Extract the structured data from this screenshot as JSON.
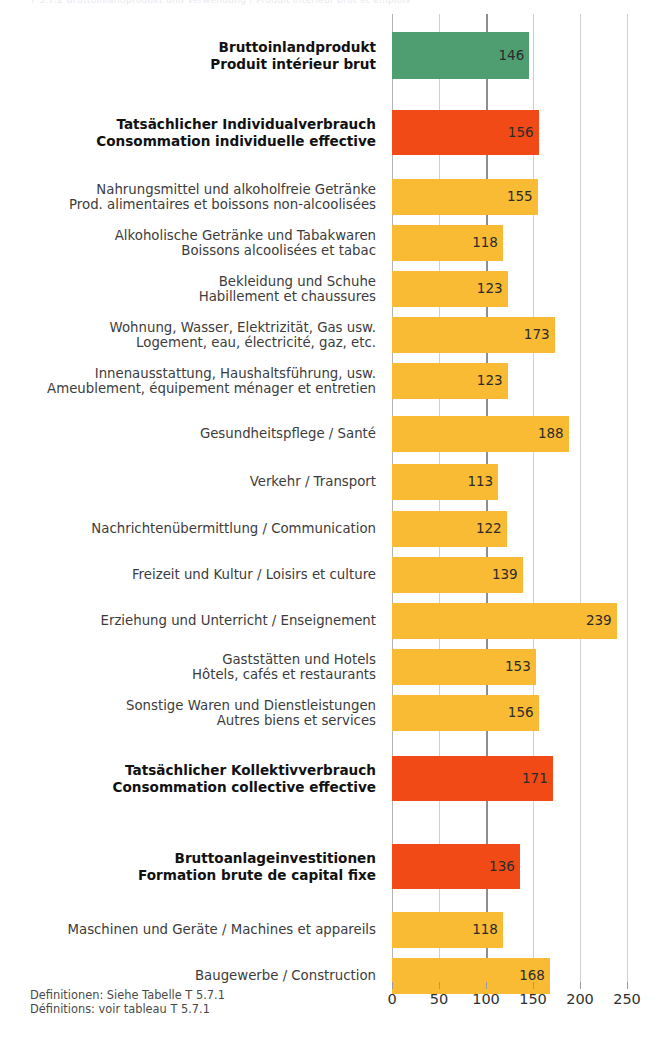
{
  "top_strip": {
    "text": "T 5.7.2  Bruttoinlandprodukt und Verwendung / Produit intérieur brut et emplois"
  },
  "footnote": {
    "line_de": "Definitionen: Siehe Tabelle T 5.7.1",
    "line_fr": "Définitions: voir tableau T 5.7.1"
  },
  "colors": {
    "green": "#4f9e72",
    "red": "#f24a16",
    "yellow": "#f9bb33",
    "gridline": "#cfcfcf",
    "gridline_major": "#8e8e8e",
    "value_text": "#2b2b2b"
  },
  "chart_data": {
    "type": "bar",
    "orientation": "horizontal",
    "title": "",
    "subtitle": "",
    "xlabel": "",
    "ylabel": "",
    "xlim": [
      0,
      250
    ],
    "ticks": [
      0,
      50,
      100,
      150,
      200,
      250
    ],
    "tick_labels": [
      "0",
      "50",
      "100",
      "150",
      "200",
      "250"
    ],
    "grid": true,
    "reference_line": 100,
    "legend": [],
    "categories": [
      "Bruttoinlandprodukt / Produit intérieur brut",
      "Tatsächlicher Individualverbrauch / Consommation individuelle effective",
      "Nahrungsmittel und alkoholfreie Getränke / Prod. alimentaires et boissons non-alcoolisées",
      "Alkoholische Getränke und Tabakwaren / Boissons alcoolisées et tabac",
      "Bekleidung und Schuhe / Habillement et chaussures",
      "Wohnung, Wasser, Elektrizität, Gas usw. / Logement, eau, électricité, gaz, etc.",
      "Innenausstattung, Haushaltsführung, usw. / Ameublement, équipement ménager et entretien",
      "Gesundheitspflege / Santé",
      "Verkehr / Transport",
      "Nachrichtenübermittlung / Communication",
      "Freizeit und Kultur / Loisirs et culture",
      "Erziehung und Unterricht / Enseignement",
      "Gaststätten und Hotels / Hôtels, cafés et restaurants",
      "Sonstige Waren und Dienstleistungen / Autres biens et services",
      "Tatsächlicher Kollektivverbrauch / Consommation collective effective",
      "Bruttoanlageinvestitionen / Formation brute de capital fixe",
      "Maschinen und Geräte / Machines et appareils",
      "Baugewerbe / Construction"
    ],
    "values": [
      146,
      156,
      155,
      118,
      123,
      173,
      123,
      188,
      113,
      122,
      139,
      239,
      153,
      156,
      171,
      136,
      118,
      168
    ]
  },
  "rows": [
    {
      "de": "Bruttoinlandprodukt",
      "fr": "Produit intérieur brut",
      "value": 146,
      "value_text": "146",
      "color_key": "green",
      "bold": true,
      "top": 18,
      "height": 47
    },
    {
      "de": "Tatsächlicher Individualverbrauch",
      "fr": "Consommation individuelle effective",
      "value": 156,
      "value_text": "156",
      "color_key": "red",
      "bold": true,
      "top": 96,
      "height": 45
    },
    {
      "de": "Nahrungsmittel und alkoholfreie Getränke",
      "fr": "Prod. alimentaires et boissons non-alcoolisées",
      "value": 155,
      "value_text": "155",
      "color_key": "yellow",
      "bold": false,
      "top": 165,
      "height": 36
    },
    {
      "de": "Alkoholische Getränke und Tabakwaren",
      "fr": "Boissons alcoolisées et tabac",
      "value": 118,
      "value_text": "118",
      "color_key": "yellow",
      "bold": false,
      "top": 211,
      "height": 36
    },
    {
      "de": "Bekleidung und Schuhe",
      "fr": "Habillement et chaussures",
      "value": 123,
      "value_text": "123",
      "color_key": "yellow",
      "bold": false,
      "top": 257,
      "height": 36
    },
    {
      "de": "Wohnung, Wasser, Elektrizität, Gas usw.",
      "fr": "Logement, eau, électricité, gaz, etc.",
      "value": 173,
      "value_text": "173",
      "color_key": "yellow",
      "bold": false,
      "top": 303,
      "height": 36
    },
    {
      "de": "Innenausstattung, Haushaltsführung, usw.",
      "fr": "Ameublement, équipement ménager et entretien",
      "value": 123,
      "value_text": "123",
      "color_key": "yellow",
      "bold": false,
      "top": 349,
      "height": 36
    },
    {
      "de": "Gesundheitspflege / Santé",
      "fr": "",
      "value": 188,
      "value_text": "188",
      "color_key": "yellow",
      "bold": false,
      "top": 402,
      "height": 36
    },
    {
      "de": "Verkehr / Transport",
      "fr": "",
      "value": 113,
      "value_text": "113",
      "color_key": "yellow",
      "bold": false,
      "top": 450,
      "height": 36
    },
    {
      "de": "Nachrichtenübermittlung / Communication",
      "fr": "",
      "value": 122,
      "value_text": "122",
      "color_key": "yellow",
      "bold": false,
      "top": 497,
      "height": 36
    },
    {
      "de": "Freizeit und Kultur / Loisirs et culture",
      "fr": "",
      "value": 139,
      "value_text": "139",
      "color_key": "yellow",
      "bold": false,
      "top": 543,
      "height": 36
    },
    {
      "de": "Erziehung und Unterricht / Enseignement",
      "fr": "",
      "value": 239,
      "value_text": "239",
      "color_key": "yellow",
      "bold": false,
      "top": 589,
      "height": 36
    },
    {
      "de": "Gaststätten und Hotels",
      "fr": "Hôtels, cafés et restaurants",
      "value": 153,
      "value_text": "153",
      "color_key": "yellow",
      "bold": false,
      "top": 635,
      "height": 36
    },
    {
      "de": "Sonstige Waren und Dienstleistungen",
      "fr": "Autres biens et services",
      "value": 156,
      "value_text": "156",
      "color_key": "yellow",
      "bold": false,
      "top": 681,
      "height": 36
    },
    {
      "de": "Tatsächlicher Kollektivverbrauch",
      "fr": "Consommation collective effective",
      "value": 171,
      "value_text": "171",
      "color_key": "red",
      "bold": true,
      "top": 742,
      "height": 45
    },
    {
      "de": "Bruttoanlageinvestitionen",
      "fr": "Formation brute de capital fixe",
      "value": 136,
      "value_text": "136",
      "color_key": "red",
      "bold": true,
      "top": 830,
      "height": 45
    },
    {
      "de": "Maschinen und Geräte / Machines et appareils",
      "fr": "",
      "value": 118,
      "value_text": "118",
      "color_key": "yellow",
      "bold": false,
      "top": 898,
      "height": 36
    },
    {
      "de": "Baugewerbe / Construction",
      "fr": "",
      "value": 168,
      "value_text": "168",
      "color_key": "yellow",
      "bold": false,
      "top": 944,
      "height": 36
    }
  ]
}
